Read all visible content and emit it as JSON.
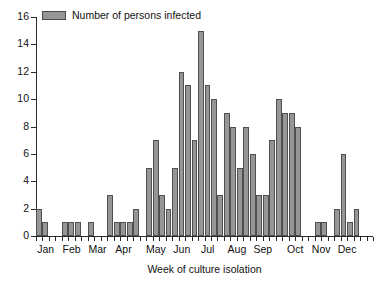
{
  "chart_data": {
    "type": "bar",
    "title": "",
    "subtitle": "",
    "xlabel": "Week of culture isolation",
    "ylabel": "",
    "ylim": [
      0,
      16
    ],
    "ytick_values": [
      0,
      2,
      4,
      6,
      8,
      10,
      12,
      14,
      16
    ],
    "ytick_labels": [
      "0",
      "2",
      "4",
      "6",
      "8",
      "10",
      "12",
      "14",
      "16"
    ],
    "grid": false,
    "legend_position": "top-left",
    "legend": [
      "Number of persons infected"
    ],
    "series": [
      {
        "name": "Number of persons infected",
        "color": "#969696",
        "edge_color": "#4f4f4f",
        "values": [
          2,
          1,
          0,
          0,
          1,
          1,
          1,
          0,
          1,
          0,
          0,
          3,
          1,
          1,
          1,
          2,
          0,
          5,
          7,
          3,
          2,
          5,
          12,
          11,
          7,
          15,
          11,
          10,
          3,
          9,
          8,
          5,
          8,
          6,
          3,
          3,
          7,
          10,
          9,
          9,
          8,
          0,
          0,
          1,
          1,
          0,
          2,
          6,
          1,
          2,
          0,
          0
        ]
      }
    ],
    "x_category_label": "week",
    "x_tick_count": 52,
    "month_labels": [
      "Jan",
      "Feb",
      "Mar",
      "Apr",
      "May",
      "Jun",
      "Jul",
      "Aug",
      "Sep",
      "Oct",
      "Nov",
      "Dec"
    ],
    "month_label_weeks": [
      1.5,
      5.5,
      9.5,
      13.5,
      18.5,
      22.5,
      26.5,
      31.0,
      35.0,
      40.0,
      44.0,
      48.0
    ]
  },
  "legend": {
    "label": "Number of persons infected",
    "swatch_color": "#969696"
  },
  "axes": {
    "x_title": "Week of culture isolation",
    "y_max_label": "16",
    "y_min_label": "0"
  },
  "colors": {
    "bar_fill": "#969696",
    "bar_edge": "#4f4f4f",
    "axis": "#2b2b2b",
    "text": "#111111",
    "background": "#ffffff"
  }
}
